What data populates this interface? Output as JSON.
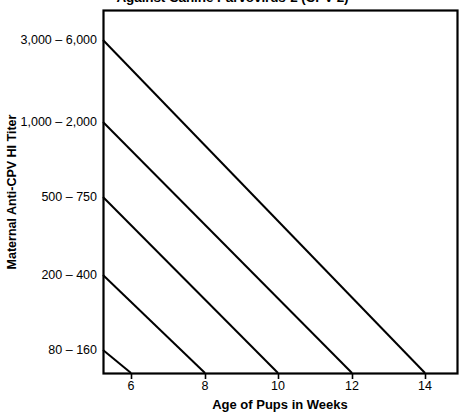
{
  "chart_data": {
    "type": "line",
    "title": "Against Canine Parvovirus-2 (CPV-2)",
    "xlabel": "Age of Pups in Weeks",
    "ylabel": "Maternal Anti-CPV HI Titer",
    "xlim": [
      5,
      15
    ],
    "x_ticks": [
      6,
      8,
      10,
      12,
      14
    ],
    "x_tick_labels": [
      "6",
      "8",
      "10",
      "12",
      "14"
    ],
    "y_categories": [
      "3,000 – 6,000",
      "1,000 – 2,000",
      "500 – 750",
      "200 – 400",
      "80 – 160"
    ],
    "grid": false,
    "legend": "none",
    "line_color": "#000000",
    "axis_color": "#000000",
    "series": [
      {
        "name": "3,000 – 6,000",
        "titer": "3,000 – 6,000",
        "start_week": 5,
        "end_week": 14,
        "points": [
          [
            5,
            "3,000 – 6,000"
          ],
          [
            14,
            "0"
          ]
        ]
      },
      {
        "name": "1,000 – 2,000",
        "titer": "1,000 – 2,000",
        "start_week": 5,
        "end_week": 12,
        "points": [
          [
            5,
            "1,000 – 2,000"
          ],
          [
            12,
            "0"
          ]
        ]
      },
      {
        "name": "500 – 750",
        "titer": "500 – 750",
        "start_week": 5,
        "end_week": 10,
        "points": [
          [
            5,
            "500 – 750"
          ],
          [
            10,
            "0"
          ]
        ]
      },
      {
        "name": "200 – 400",
        "titer": "200 – 400",
        "start_week": 5,
        "end_week": 8,
        "points": [
          [
            5,
            "200 – 400"
          ],
          [
            8,
            "0"
          ]
        ]
      },
      {
        "name": "80 – 160",
        "titer": "80 – 160",
        "start_week": 5,
        "end_week": 6,
        "points": [
          [
            5,
            "80 – 160"
          ],
          [
            6,
            "0"
          ]
        ]
      }
    ]
  },
  "chart": {
    "title": "Against Canine Parvovirus-2 (CPV-2)",
    "x_axis": {
      "title": "Age of Pups in Weeks",
      "ticks": [
        {
          "label": "6",
          "px": 131
        },
        {
          "label": "8",
          "px": 205
        },
        {
          "label": "10",
          "px": 278
        },
        {
          "label": "12",
          "px": 352
        },
        {
          "label": "14",
          "px": 425
        }
      ]
    },
    "y_axis": {
      "title": "Maternal Anti-CPV HI Titer",
      "ticks": [
        {
          "label": "3,000 – 6,000",
          "px": 33
        },
        {
          "label": "1,000 – 2,000",
          "px": 115
        },
        {
          "label": "500 – 750",
          "px": 190
        },
        {
          "label": "200 – 400",
          "px": 268
        },
        {
          "label": "80 – 160",
          "px": 343
        }
      ]
    },
    "plot_area": {
      "left": 103,
      "top": 10,
      "right": 457,
      "bottom": 373
    },
    "lines": [
      {
        "name": "decay-line-3000-6000",
        "x1": 103,
        "y1": 40,
        "x2": 425,
        "y2": 373
      },
      {
        "name": "decay-line-1000-2000",
        "x1": 103,
        "y1": 122,
        "x2": 352,
        "y2": 373
      },
      {
        "name": "decay-line-500-750",
        "x1": 103,
        "y1": 197,
        "x2": 278,
        "y2": 373
      },
      {
        "name": "decay-line-200-400",
        "x1": 103,
        "y1": 275,
        "x2": 205,
        "y2": 373
      },
      {
        "name": "decay-line-80-160",
        "x1": 103,
        "y1": 350,
        "x2": 131,
        "y2": 373
      }
    ]
  }
}
